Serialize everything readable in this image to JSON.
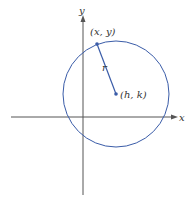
{
  "diagram": {
    "title": "",
    "axes": {
      "x_label": "x",
      "y_label": "y"
    },
    "circle": {
      "color": "#3a5ca8",
      "center_label": "(h, k)",
      "radius_label": "r",
      "point_label": "(x, y)"
    },
    "axis_color": "#555555"
  }
}
